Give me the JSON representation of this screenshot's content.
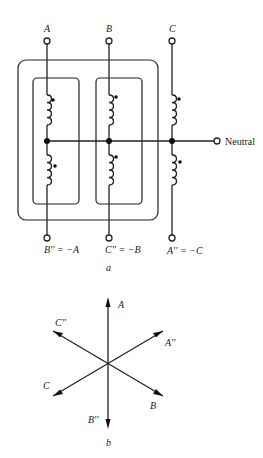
{
  "figure_a": {
    "caption": "a",
    "top_terminals": [
      "A",
      "B",
      "C"
    ],
    "bottom_terminals": [
      "B'' = −A",
      "C'' = −B",
      "A'' = −C"
    ],
    "neutral_label": "Neutral"
  },
  "figure_b": {
    "caption": "b",
    "phasors": [
      {
        "label": "A",
        "angle_deg": 90
      },
      {
        "label": "A''",
        "angle_deg": 30
      },
      {
        "label": "B",
        "angle_deg": -30
      },
      {
        "label": "B''",
        "angle_deg": -90
      },
      {
        "label": "C",
        "angle_deg": -150
      },
      {
        "label": "C''",
        "angle_deg": 150
      }
    ]
  }
}
